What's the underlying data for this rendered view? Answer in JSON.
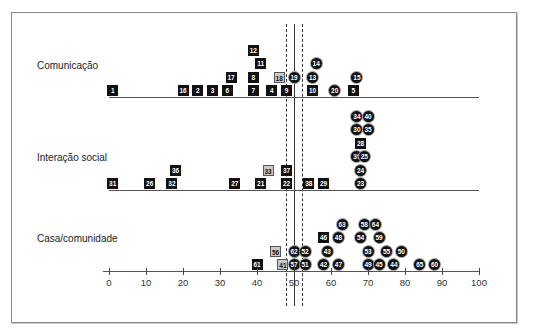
{
  "chart_data": {
    "type": "scatter",
    "subtype": "dot-plot",
    "title": "",
    "xlabel": "",
    "ylabel": "",
    "xlim": [
      0,
      100
    ],
    "x_ticks": [
      0,
      10,
      20,
      30,
      40,
      50,
      60,
      70,
      80,
      90,
      100
    ],
    "grid": false,
    "legend": null,
    "reference_lines": [
      {
        "value": 50,
        "style": "solid"
      },
      {
        "value": 47.8,
        "style": "dashed"
      },
      {
        "value": 52.2,
        "style": "dashed"
      }
    ],
    "marker_styles": {
      "square": "black square with white number",
      "circle": "black circle with white number",
      "light": "light grey square with dark number"
    },
    "groups": [
      {
        "name": "Comunicação",
        "points": [
          {
            "id": "1",
            "x": 1,
            "row": 0,
            "shape": "square"
          },
          {
            "id": "16",
            "x": 20,
            "row": 0,
            "shape": "square"
          },
          {
            "id": "2",
            "x": 24,
            "row": 0,
            "shape": "square"
          },
          {
            "id": "3",
            "x": 28,
            "row": 0,
            "shape": "square"
          },
          {
            "id": "6",
            "x": 32,
            "row": 0,
            "shape": "square"
          },
          {
            "id": "7",
            "x": 39,
            "row": 0,
            "shape": "square"
          },
          {
            "id": "4",
            "x": 44,
            "row": 0,
            "shape": "square"
          },
          {
            "id": "9",
            "x": 48,
            "row": 0,
            "shape": "square"
          },
          {
            "id": "10",
            "x": 55,
            "row": 0,
            "shape": "square"
          },
          {
            "id": "20",
            "x": 61,
            "row": 0,
            "shape": "circle"
          },
          {
            "id": "5",
            "x": 66,
            "row": 0,
            "shape": "square"
          },
          {
            "id": "17",
            "x": 33,
            "row": 1,
            "shape": "square"
          },
          {
            "id": "8",
            "x": 39,
            "row": 1,
            "shape": "square"
          },
          {
            "id": "18",
            "x": 46,
            "row": 1,
            "shape": "light"
          },
          {
            "id": "19",
            "x": 50,
            "row": 1,
            "shape": "circle"
          },
          {
            "id": "13",
            "x": 55,
            "row": 1,
            "shape": "circle"
          },
          {
            "id": "15",
            "x": 67,
            "row": 1,
            "shape": "circle"
          },
          {
            "id": "11",
            "x": 41,
            "row": 2,
            "shape": "square"
          },
          {
            "id": "14",
            "x": 56,
            "row": 2,
            "shape": "circle"
          },
          {
            "id": "12",
            "x": 39,
            "row": 3,
            "shape": "square"
          }
        ]
      },
      {
        "name": "Interação social",
        "points": [
          {
            "id": "31",
            "x": 1,
            "row": 0,
            "shape": "square"
          },
          {
            "id": "26",
            "x": 11,
            "row": 0,
            "shape": "square"
          },
          {
            "id": "32",
            "x": 17,
            "row": 0,
            "shape": "square"
          },
          {
            "id": "27",
            "x": 34,
            "row": 0,
            "shape": "square"
          },
          {
            "id": "21",
            "x": 41,
            "row": 0,
            "shape": "square"
          },
          {
            "id": "22",
            "x": 48,
            "row": 0,
            "shape": "square"
          },
          {
            "id": "38",
            "x": 54,
            "row": 0,
            "shape": "square"
          },
          {
            "id": "29",
            "x": 58,
            "row": 0,
            "shape": "square"
          },
          {
            "id": "23",
            "x": 68,
            "row": 0,
            "shape": "circle"
          },
          {
            "id": "36",
            "x": 18,
            "row": 1,
            "shape": "square"
          },
          {
            "id": "33",
            "x": 43,
            "row": 1,
            "shape": "light"
          },
          {
            "id": "37",
            "x": 48,
            "row": 1,
            "shape": "square"
          },
          {
            "id": "24",
            "x": 68,
            "row": 1,
            "shape": "circle"
          },
          {
            "id": "39",
            "x": 67,
            "row": 2,
            "shape": "circle"
          },
          {
            "id": "25",
            "x": 69,
            "row": 2,
            "shape": "circle"
          },
          {
            "id": "28",
            "x": 68,
            "row": 3,
            "shape": "square"
          },
          {
            "id": "30",
            "x": 67,
            "row": 4,
            "shape": "circle"
          },
          {
            "id": "35",
            "x": 70,
            "row": 4,
            "shape": "circle"
          },
          {
            "id": "34",
            "x": 67,
            "row": 5,
            "shape": "circle"
          },
          {
            "id": "40",
            "x": 70,
            "row": 5,
            "shape": "circle"
          }
        ]
      },
      {
        "name": "Casa/comunidade",
        "points": [
          {
            "id": "61",
            "x": 40,
            "row": 0,
            "shape": "square"
          },
          {
            "id": "41",
            "x": 47,
            "row": 0,
            "shape": "light"
          },
          {
            "id": "57",
            "x": 50,
            "row": 0,
            "shape": "circle"
          },
          {
            "id": "51",
            "x": 53,
            "row": 0,
            "shape": "circle"
          },
          {
            "id": "42",
            "x": 58,
            "row": 0,
            "shape": "circle"
          },
          {
            "id": "47",
            "x": 62,
            "row": 0,
            "shape": "circle"
          },
          {
            "id": "49",
            "x": 70,
            "row": 0,
            "shape": "circle"
          },
          {
            "id": "45",
            "x": 73,
            "row": 0,
            "shape": "circle"
          },
          {
            "id": "44",
            "x": 77,
            "row": 0,
            "shape": "circle"
          },
          {
            "id": "65",
            "x": 84,
            "row": 0,
            "shape": "circle"
          },
          {
            "id": "60",
            "x": 88,
            "row": 0,
            "shape": "circle"
          },
          {
            "id": "56",
            "x": 45,
            "row": 1,
            "shape": "light"
          },
          {
            "id": "62",
            "x": 50,
            "row": 1,
            "shape": "circle"
          },
          {
            "id": "52",
            "x": 53,
            "row": 1,
            "shape": "circle"
          },
          {
            "id": "43",
            "x": 59,
            "row": 1,
            "shape": "circle"
          },
          {
            "id": "53",
            "x": 70,
            "row": 1,
            "shape": "circle"
          },
          {
            "id": "55",
            "x": 75,
            "row": 1,
            "shape": "circle"
          },
          {
            "id": "50",
            "x": 79,
            "row": 1,
            "shape": "circle"
          },
          {
            "id": "46",
            "x": 58,
            "row": 2,
            "shape": "square"
          },
          {
            "id": "48",
            "x": 62,
            "row": 2,
            "shape": "circle"
          },
          {
            "id": "54",
            "x": 68,
            "row": 2,
            "shape": "circle"
          },
          {
            "id": "59",
            "x": 73,
            "row": 2,
            "shape": "circle"
          },
          {
            "id": "63",
            "x": 63,
            "row": 3,
            "shape": "circle"
          },
          {
            "id": "58",
            "x": 69,
            "row": 3,
            "shape": "circle"
          },
          {
            "id": "64",
            "x": 72,
            "row": 3,
            "shape": "circle"
          }
        ]
      }
    ]
  },
  "layout": {
    "x0_px": 109,
    "px_per_unit": 3.7,
    "row_step_px": 13.5,
    "groups": [
      {
        "label_left": 37,
        "label_top": 60,
        "baseline_y": 97,
        "baseline_x1": 109,
        "baseline_x2": 479
      },
      {
        "label_left": 37,
        "label_top": 152,
        "baseline_y": 190,
        "baseline_x1": 109,
        "baseline_x2": 479
      },
      {
        "label_left": 37,
        "label_top": 233,
        "baseline_y": 271,
        "baseline_x1": 103,
        "baseline_x2": 480
      }
    ],
    "axis_y": 271,
    "ref_top": 24,
    "ref_bottom": 306
  }
}
